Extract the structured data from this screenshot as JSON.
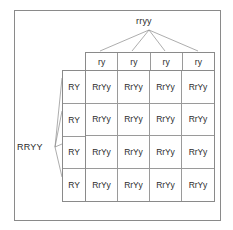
{
  "diagram": {
    "type": "punnett-square",
    "title_text": "",
    "parents": {
      "top": {
        "genotype": "rryy",
        "gametes": [
          "ry",
          "ry",
          "ry",
          "ry"
        ]
      },
      "left": {
        "genotype": "RRYY",
        "gametes": [
          "RY",
          "RY",
          "RY",
          "RY"
        ]
      }
    },
    "grid": {
      "rows": 4,
      "cols": 4,
      "offspring": [
        [
          "RrYy",
          "RrYy",
          "RrYy",
          "RrYy"
        ],
        [
          "RrYy",
          "RrYy",
          "RrYy",
          "RrYy"
        ],
        [
          "RrYy",
          "RrYy",
          "RrYy",
          "RrYy"
        ],
        [
          "RrYy",
          "RrYy",
          "RrYy",
          "RrYy"
        ]
      ]
    },
    "colors": {
      "frame": "#8a8a8a",
      "grid_line": "#9a9a9a",
      "text": "#2b2b2b",
      "connector": "#8a8a8a",
      "background": "#ffffff"
    }
  }
}
